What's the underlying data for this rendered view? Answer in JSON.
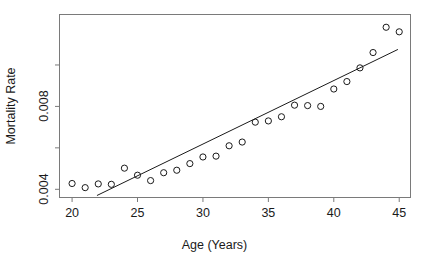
{
  "chart_data": {
    "type": "scatter",
    "title": "",
    "xlabel": "Age (Years)",
    "ylabel": "Mortality Rate",
    "xlim": [
      19.0,
      45.9
    ],
    "ylim": [
      0.00358,
      0.01246
    ],
    "grid": false,
    "legend": null,
    "x_ticks": [
      20,
      25,
      30,
      35,
      40,
      45
    ],
    "x_tick_labels": [
      "20",
      "25",
      "30",
      "35",
      "40",
      "45"
    ],
    "y_ticks": [
      0.004,
      0.006,
      0.008,
      0.01
    ],
    "y_tick_labels": [
      "0.004",
      "",
      "0.008",
      ""
    ],
    "marker": "open-circle",
    "x": [
      20,
      21,
      22,
      23,
      24,
      25,
      26,
      27,
      28,
      29,
      30,
      31,
      32,
      33,
      34,
      35,
      36,
      37,
      38,
      39,
      40,
      41,
      42,
      43,
      44,
      45
    ],
    "y": [
      0.00428,
      0.00408,
      0.00426,
      0.00424,
      0.00502,
      0.00468,
      0.00442,
      0.0048,
      0.00492,
      0.00524,
      0.00556,
      0.0056,
      0.0061,
      0.00628,
      0.00724,
      0.0073,
      0.0075,
      0.00806,
      0.00804,
      0.008,
      0.00884,
      0.0092,
      0.00986,
      0.0106,
      0.01182,
      0.0116
    ],
    "series": [
      {
        "name": "Observed mortality rate",
        "type": "scatter",
        "values": [
          0.00428,
          0.00408,
          0.00426,
          0.00424,
          0.00502,
          0.00468,
          0.00442,
          0.0048,
          0.00492,
          0.00524,
          0.00556,
          0.0056,
          0.0061,
          0.00628,
          0.00724,
          0.0073,
          0.0075,
          0.00806,
          0.00804,
          0.008,
          0.00884,
          0.0092,
          0.00986,
          0.0106,
          0.01182,
          0.0116
        ]
      },
      {
        "name": "Fitted regression line",
        "type": "line",
        "x_endpoints": [
          21.9,
          44.9
        ],
        "y_endpoints": [
          0.0037,
          0.01075
        ]
      }
    ]
  },
  "axes": {
    "y_title": "Mortality Rate",
    "x_title": "Age (Years)"
  },
  "colors": {
    "frame": "#7a7a7a",
    "marker": "#1a1a1a",
    "line": "#1a1a1a",
    "text": "#1a1a1a",
    "background": "#ffffff"
  }
}
